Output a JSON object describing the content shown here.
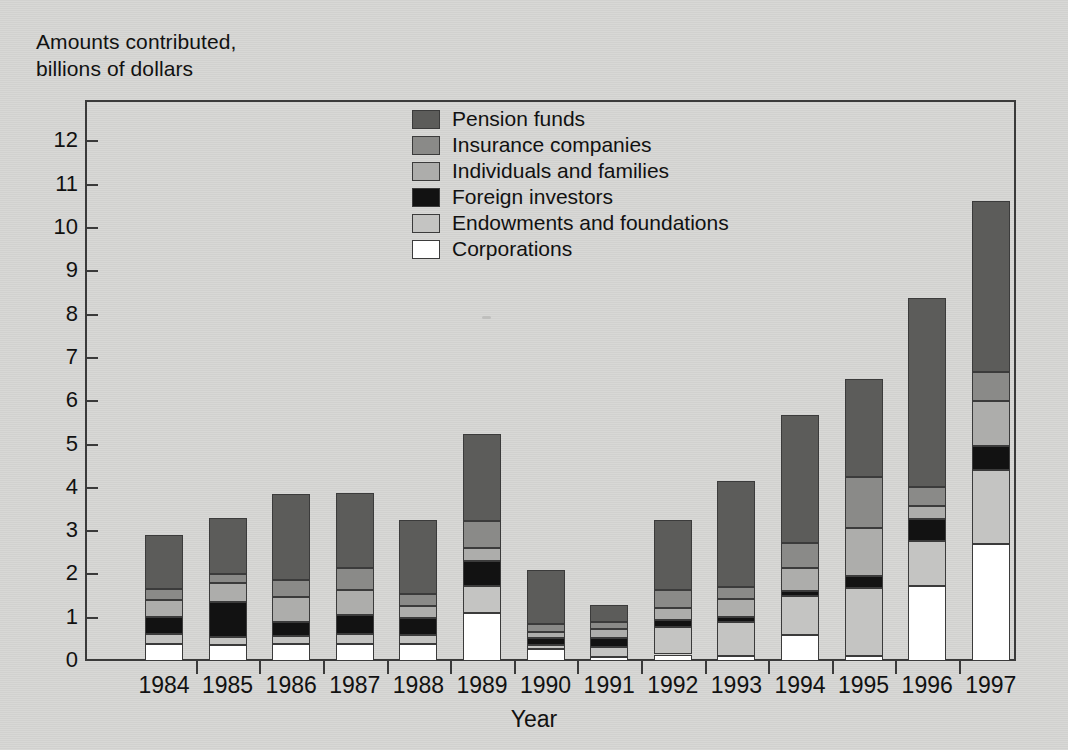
{
  "chart_data": {
    "type": "bar",
    "stacked": true,
    "title": "",
    "ylabel": "Amounts contributed,\nbillions of dollars",
    "xlabel": "Year",
    "categories": [
      "1984",
      "1985",
      "1986",
      "1987",
      "1988",
      "1989",
      "1990",
      "1991",
      "1992",
      "1993",
      "1994",
      "1995",
      "1996",
      "1997"
    ],
    "ylim": [
      0,
      12.6
    ],
    "yticks": [
      0,
      1,
      2,
      3,
      4,
      5,
      6,
      7,
      8,
      9,
      10,
      11,
      12
    ],
    "ytick_labels": [
      "0",
      "1",
      "2",
      "3",
      "4",
      "5",
      "6",
      "7",
      "8",
      "9",
      "10",
      "11",
      "12"
    ],
    "grid": false,
    "legend_position": "upper-center",
    "stack_order_bottom_to_top": [
      "Corporations",
      "Endowments and foundations",
      "Foreign investors",
      "Individuals and families",
      "Insurance companies",
      "Pension funds"
    ],
    "series": [
      {
        "name": "Corporations",
        "color": "#ffffff",
        "values": [
          0.4,
          0.38,
          0.4,
          0.4,
          0.4,
          1.12,
          0.27,
          0.1,
          0.15,
          0.12,
          0.6,
          0.12,
          1.73,
          2.7
        ]
      },
      {
        "name": "Endowments and foundations",
        "color": "#c4c4c2",
        "values": [
          0.22,
          0.17,
          0.17,
          0.22,
          0.2,
          0.62,
          0.1,
          0.22,
          0.63,
          0.78,
          0.9,
          1.57,
          1.04,
          1.71
        ]
      },
      {
        "name": "Foreign investors",
        "color": "#121212",
        "values": [
          0.4,
          0.82,
          0.33,
          0.45,
          0.4,
          0.58,
          0.15,
          0.2,
          0.17,
          0.12,
          0.12,
          0.27,
          0.51,
          0.55
        ]
      },
      {
        "name": "Individuals and families",
        "color": "#adadab",
        "values": [
          0.4,
          0.43,
          0.57,
          0.57,
          0.28,
          0.3,
          0.15,
          0.22,
          0.28,
          0.42,
          0.53,
          1.12,
          0.31,
          1.05
        ]
      },
      {
        "name": "Insurance companies",
        "color": "#8a8a88",
        "values": [
          0.25,
          0.2,
          0.4,
          0.51,
          0.27,
          0.62,
          0.18,
          0.15,
          0.4,
          0.28,
          0.58,
          1.17,
          0.42,
          0.67
        ]
      },
      {
        "name": "Pension funds",
        "color": "#5c5c5a",
        "values": [
          1.23,
          1.3,
          1.98,
          1.72,
          1.7,
          2.0,
          1.25,
          0.41,
          1.62,
          2.43,
          2.95,
          2.27,
          4.37,
          3.95
        ]
      }
    ],
    "totals": [
      2.9,
      3.3,
      3.85,
      3.87,
      3.25,
      5.24,
      2.1,
      1.3,
      3.25,
      4.15,
      5.68,
      6.52,
      8.38,
      10.63
    ]
  },
  "legend": {
    "items": [
      {
        "label": "Pension funds",
        "color": "#5c5c5a"
      },
      {
        "label": "Insurance companies",
        "color": "#8a8a88"
      },
      {
        "label": "Individuals and families",
        "color": "#adadab"
      },
      {
        "label": "Foreign investors",
        "color": "#121212"
      },
      {
        "label": "Endowments and foundations",
        "color": "#c4c4c2"
      },
      {
        "label": "Corporations",
        "color": "#ffffff"
      }
    ]
  },
  "axes": {
    "y_axis_title": "Amounts contributed,\nbillions of dollars",
    "x_axis_title": "Year"
  },
  "colors": {
    "page_background": "#d3d3d1",
    "axis_line": "#3a3a3a",
    "text": "#111111"
  }
}
